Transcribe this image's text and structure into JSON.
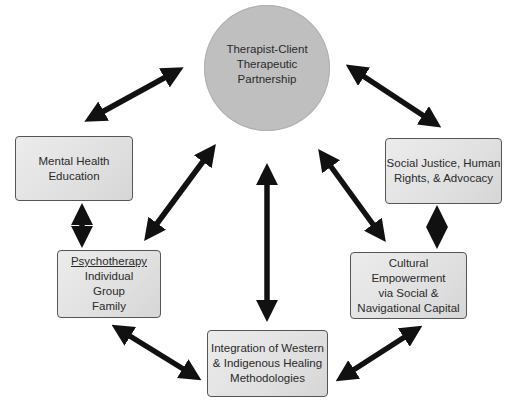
{
  "diagram": {
    "hub": {
      "lines": [
        "Therapist-Client",
        "Therapeutic",
        "Partnership"
      ],
      "color": "#bfbfbf"
    },
    "nodes": {
      "mental_health_education": {
        "lines": [
          "Mental Health",
          "Education"
        ]
      },
      "social_justice": {
        "lines": [
          "Social Justice, Human",
          "Rights, & Advocacy"
        ]
      },
      "psychotherapy": {
        "title": "Psychotherapy",
        "lines": [
          "Individual",
          "Group",
          "Family"
        ]
      },
      "cultural_empowerment": {
        "lines": [
          "Cultural Empowerment",
          "via Social &",
          "Navigational Capital"
        ]
      },
      "integration": {
        "lines": [
          "Integration of Western",
          "& Indigenous Healing",
          "Methodologies"
        ]
      }
    },
    "connections": [
      {
        "from": "hub",
        "to": "mental_health_education",
        "type": "bidirectional"
      },
      {
        "from": "hub",
        "to": "social_justice",
        "type": "bidirectional"
      },
      {
        "from": "hub",
        "to": "psychotherapy",
        "type": "bidirectional"
      },
      {
        "from": "hub",
        "to": "cultural_empowerment",
        "type": "bidirectional"
      },
      {
        "from": "hub",
        "to": "integration",
        "type": "bidirectional"
      },
      {
        "from": "mental_health_education",
        "to": "psychotherapy",
        "type": "bidirectional"
      },
      {
        "from": "social_justice",
        "to": "cultural_empowerment",
        "type": "bidirectional"
      },
      {
        "from": "psychotherapy",
        "to": "integration",
        "type": "bidirectional"
      },
      {
        "from": "cultural_empowerment",
        "to": "integration",
        "type": "bidirectional"
      }
    ],
    "arrow_color": "#111111",
    "box_border_color": "#555555"
  }
}
